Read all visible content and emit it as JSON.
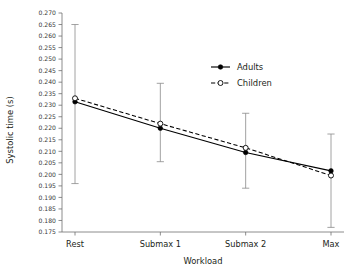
{
  "chart_data": {
    "type": "line",
    "title": "",
    "subtitle": "",
    "xlabel": "Workload",
    "ylabel": "Systolic time (s)",
    "categories": [
      "Rest",
      "Submax 1",
      "Submax 2",
      "Max"
    ],
    "ylim": [
      0.175,
      0.27
    ],
    "ytick_step": 0.005,
    "ytick_labels": [
      "0.270",
      "0.265",
      "0.260",
      "0.255",
      "0.250",
      "0.245",
      "0.240",
      "0.235",
      "0.230",
      "0.225",
      "0.220",
      "0.215",
      "0.210",
      "0.205",
      "0.200",
      "0.195",
      "0.190",
      "0.185",
      "0.180",
      "0.175"
    ],
    "ytick_values": [
      0.27,
      0.265,
      0.26,
      0.255,
      0.25,
      0.245,
      0.24,
      0.235,
      0.23,
      0.225,
      0.22,
      0.215,
      0.21,
      0.205,
      0.2,
      0.195,
      0.19,
      0.185,
      0.18,
      0.175
    ],
    "grid": false,
    "legend_position": "upper right",
    "series": [
      {
        "name": "Adults",
        "linestyle": "solid",
        "marker": "filled-circle",
        "color": "#000000",
        "values": [
          0.2315,
          0.22,
          0.2095,
          0.2015
        ],
        "errorbar_low": [
          0.196,
          0.2055,
          0.194,
          0.177
        ],
        "errorbar_high": [
          0.265,
          0.2395,
          0.2265,
          0.2175
        ]
      },
      {
        "name": "Children",
        "linestyle": "dashed",
        "marker": "open-circle",
        "color": "#000000",
        "values": [
          0.233,
          0.222,
          0.2115,
          0.1995
        ],
        "errorbar_low": [
          null,
          null,
          null,
          null
        ],
        "errorbar_high": [
          null,
          null,
          null,
          null
        ]
      }
    ]
  },
  "legend": {
    "entries": [
      {
        "label": "Adults"
      },
      {
        "label": "Children"
      }
    ]
  },
  "axes": {
    "y_title": "Systolic time (s)",
    "x_title": "Workload"
  }
}
